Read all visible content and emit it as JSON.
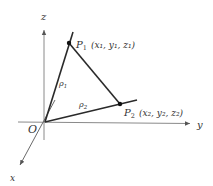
{
  "diagram": {
    "type": "3d-coordinate-vectors",
    "colors": {
      "axis": "#8a8a8a",
      "segment": "#2a2a2a",
      "text": "#333333",
      "background": "#ffffff"
    },
    "axes": {
      "z_label": "z",
      "y_label": "y",
      "x_label": "x",
      "origin_label": "O"
    },
    "points": [
      {
        "id": "P1",
        "name": "P",
        "subscript": "1",
        "coords": "(x₁, y₁, z₁)"
      },
      {
        "id": "P2",
        "name": "P",
        "subscript": "2",
        "coords": "(x₂, y₂, z₂)"
      }
    ],
    "vectors": [
      {
        "from": "O",
        "to": "P1",
        "label": "ρ",
        "subscript": "1"
      },
      {
        "from": "O",
        "to": "P2",
        "label": "ρ",
        "subscript": "2"
      }
    ],
    "segments": [
      {
        "from": "P1",
        "to": "P2"
      }
    ]
  }
}
